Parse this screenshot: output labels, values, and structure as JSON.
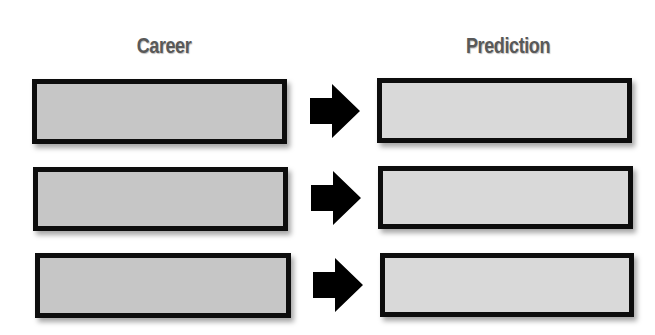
{
  "diagram": {
    "columns": {
      "left_header": "Career",
      "right_header": "Prediction"
    },
    "rows": [
      {
        "career": "",
        "prediction": "",
        "connector": "right-arrow-icon"
      },
      {
        "career": "",
        "prediction": "",
        "connector": "right-arrow-icon"
      },
      {
        "career": "",
        "prediction": "",
        "connector": "right-arrow-icon"
      }
    ],
    "colors": {
      "career_fill": "#c6c6c6",
      "prediction_fill": "#d9d9d9",
      "border": "#0d0d0d",
      "header_text": "#595959",
      "arrow": "#000000"
    }
  }
}
